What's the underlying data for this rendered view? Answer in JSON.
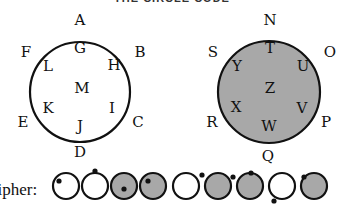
{
  "title": "THE CIRCLE CODE",
  "fill_color": "#a8a8a8",
  "stroke_color": "#111111",
  "left_wheel": {
    "name": "white-circle",
    "filled": false,
    "center": [
      80,
      92
    ],
    "radius": 50,
    "outer": [
      {
        "letter": "A",
        "x": 80,
        "y": 20
      },
      {
        "letter": "B",
        "x": 140,
        "y": 52
      },
      {
        "letter": "C",
        "x": 138,
        "y": 122
      },
      {
        "letter": "D",
        "x": 80,
        "y": 152
      },
      {
        "letter": "E",
        "x": 23,
        "y": 122
      },
      {
        "letter": "F",
        "x": 26,
        "y": 52
      }
    ],
    "inner": [
      {
        "letter": "G",
        "x": 80,
        "y": 48
      },
      {
        "letter": "H",
        "x": 114,
        "y": 65
      },
      {
        "letter": "I",
        "x": 112,
        "y": 108
      },
      {
        "letter": "J",
        "x": 80,
        "y": 126
      },
      {
        "letter": "K",
        "x": 48,
        "y": 108
      },
      {
        "letter": "L",
        "x": 48,
        "y": 66
      },
      {
        "letter": "M",
        "x": 82,
        "y": 88
      }
    ]
  },
  "right_wheel": {
    "name": "shaded-circle",
    "filled": true,
    "center": [
      269,
      92
    ],
    "radius": 51,
    "outer": [
      {
        "letter": "N",
        "x": 270,
        "y": 20
      },
      {
        "letter": "O",
        "x": 330,
        "y": 52
      },
      {
        "letter": "P",
        "x": 326,
        "y": 122
      },
      {
        "letter": "Q",
        "x": 268,
        "y": 156
      },
      {
        "letter": "R",
        "x": 212,
        "y": 122
      },
      {
        "letter": "S",
        "x": 213,
        "y": 52
      }
    ],
    "inner": [
      {
        "letter": "T",
        "x": 270,
        "y": 48
      },
      {
        "letter": "U",
        "x": 303,
        "y": 66
      },
      {
        "letter": "V",
        "x": 302,
        "y": 108
      },
      {
        "letter": "W",
        "x": 269,
        "y": 126
      },
      {
        "letter": "X",
        "x": 236,
        "y": 107
      },
      {
        "letter": "Y",
        "x": 237,
        "y": 66
      },
      {
        "letter": "Z",
        "x": 270,
        "y": 88
      }
    ]
  },
  "cipher": {
    "label": "cipher:",
    "symbols": [
      {
        "cx": 66,
        "cy": 186,
        "filled": false,
        "dot": [
          59,
          181
        ]
      },
      {
        "cx": 95,
        "cy": 186,
        "filled": false,
        "dot": [
          95,
          171
        ]
      },
      {
        "cx": 124,
        "cy": 186,
        "filled": true,
        "dot": [
          124,
          189
        ]
      },
      {
        "cx": 153,
        "cy": 186,
        "filled": true,
        "dot": [
          148,
          181
        ]
      },
      {
        "cx": 186,
        "cy": 186,
        "filled": false,
        "dot": [
          202,
          175
        ]
      },
      {
        "cx": 218,
        "cy": 186,
        "filled": true,
        "dot": [
          233,
          177
        ]
      },
      {
        "cx": 250,
        "cy": 186,
        "filled": true,
        "dot": [
          251,
          173
        ]
      },
      {
        "cx": 282,
        "cy": 186,
        "filled": false,
        "dot": [
          274,
          201
        ]
      },
      {
        "cx": 314,
        "cy": 186,
        "filled": true,
        "dot": [
          304,
          177
        ]
      }
    ]
  }
}
